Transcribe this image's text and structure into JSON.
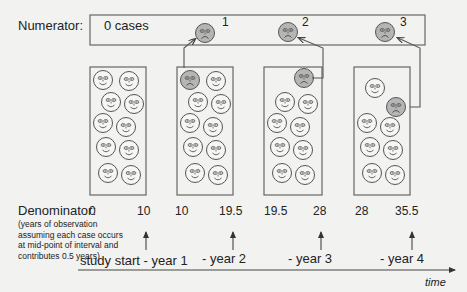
{
  "numerator": {
    "label": "Numerator:",
    "zero_cases": "0 cases",
    "case_numbers": [
      "1",
      "2",
      "3"
    ]
  },
  "groups": [
    {
      "id": "year1",
      "smiley_count": 10,
      "sad_count": 0,
      "denominator_start": "0",
      "denominator_end": "10"
    },
    {
      "id": "year2",
      "smiley_count": 9,
      "sad_count": 1,
      "denominator_start": "10",
      "denominator_end": "19.5"
    },
    {
      "id": "year3",
      "smiley_count": 8,
      "sad_count": 1,
      "denominator_start": "19.5",
      "denominator_end": "28"
    },
    {
      "id": "year4",
      "smiley_count": 7,
      "sad_count": 1,
      "denominator_start": "28",
      "denominator_end": "35.5"
    }
  ],
  "denominator": {
    "label": "Denominator:",
    "note": "(years of observation assuming each case occurs at mid-point of interval and contributes 0.5 years)"
  },
  "timeline": {
    "labels": [
      "study start - year 1",
      "- year 2",
      "- year 3",
      "- year 4"
    ],
    "axis_label": "time"
  },
  "colors": {
    "line": "#555555",
    "sad_face_fill": "#b5b5b5",
    "happy_face_fill": "#f6f6f4",
    "background": "#f2f2f0"
  },
  "icons": {
    "happy": "smiley-face-icon",
    "sad": "sad-face-icon"
  }
}
